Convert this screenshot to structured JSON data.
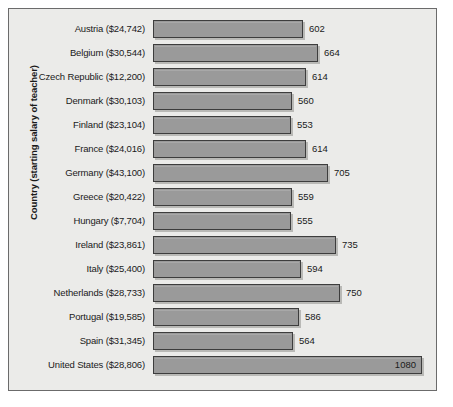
{
  "chart_data": {
    "type": "bar",
    "orientation": "horizontal",
    "title": "",
    "xlabel": "",
    "ylabel": "Country (starting salary of teacher)",
    "grid": false,
    "legend": null,
    "xlim": [
      0,
      1145
    ],
    "value_label_position": "end-outside (inside for max bar)",
    "categories": [
      "Austria ($24,742)",
      "Belgium ($30,544)",
      "Czech Republic ($12,200)",
      "Denmark ($30,103)",
      "Finland ($23,104)",
      "France ($24,016)",
      "Germany ($43,100)",
      "Greece ($20,422)",
      "Hungary ($7,704)",
      "Ireland ($23,861)",
      "Italy ($25,400)",
      "Netherlands ($28,733)",
      "Portugal ($19,585)",
      "Spain ($31,345)",
      "United States ($28,806)"
    ],
    "values": [
      602,
      664,
      614,
      560,
      553,
      614,
      705,
      559,
      555,
      735,
      594,
      750,
      586,
      564,
      1080
    ],
    "bars": [
      {
        "category": "Austria ($24,742)",
        "country": "Austria",
        "salary": "$24,742",
        "value": 602,
        "label": "602",
        "label_inside": false
      },
      {
        "category": "Belgium ($30,544)",
        "country": "Belgium",
        "salary": "$30,544",
        "value": 664,
        "label": "664",
        "label_inside": false
      },
      {
        "category": "Czech Republic ($12,200)",
        "country": "Czech Republic",
        "salary": "$12,200",
        "value": 614,
        "label": "614",
        "label_inside": false
      },
      {
        "category": "Denmark ($30,103)",
        "country": "Denmark",
        "salary": "$30,103",
        "value": 560,
        "label": "560",
        "label_inside": false
      },
      {
        "category": "Finland ($23,104)",
        "country": "Finland",
        "salary": "$23,104",
        "value": 553,
        "label": "553",
        "label_inside": false
      },
      {
        "category": "France ($24,016)",
        "country": "France",
        "salary": "$24,016",
        "value": 614,
        "label": "614",
        "label_inside": false
      },
      {
        "category": "Germany ($43,100)",
        "country": "Germany",
        "salary": "$43,100",
        "value": 705,
        "label": "705",
        "label_inside": false
      },
      {
        "category": "Greece ($20,422)",
        "country": "Greece",
        "salary": "$20,422",
        "value": 559,
        "label": "559",
        "label_inside": false
      },
      {
        "category": "Hungary ($7,704)",
        "country": "Hungary",
        "salary": "$7,704",
        "value": 555,
        "label": "555",
        "label_inside": false
      },
      {
        "category": "Ireland ($23,861)",
        "country": "Ireland",
        "salary": "$23,861",
        "value": 735,
        "label": "735",
        "label_inside": false
      },
      {
        "category": "Italy ($25,400)",
        "country": "Italy",
        "salary": "$25,400",
        "value": 594,
        "label": "594",
        "label_inside": false
      },
      {
        "category": "Netherlands ($28,733)",
        "country": "Netherlands",
        "salary": "$28,733",
        "value": 750,
        "label": "750",
        "label_inside": false
      },
      {
        "category": "Portugal ($19,585)",
        "country": "Portugal",
        "salary": "$19,585",
        "value": 586,
        "label": "586",
        "label_inside": false
      },
      {
        "category": "Spain ($31,345)",
        "country": "Spain",
        "salary": "$31,345",
        "value": 564,
        "label": "564",
        "label_inside": false
      },
      {
        "category": "United States ($28,806)",
        "country": "United States",
        "salary": "$28,806",
        "value": 1080,
        "label": "1080",
        "label_inside": true
      }
    ]
  },
  "colors": {
    "bar_fill": "#9a9a9a",
    "bar_border": "#3d3d3d",
    "bar_shadow": "#b9b9b6",
    "plot_background": "#ebebe9",
    "frame_border": "#6b6b6b",
    "text": "#1a1a1a",
    "page_background": "#ffffff"
  }
}
